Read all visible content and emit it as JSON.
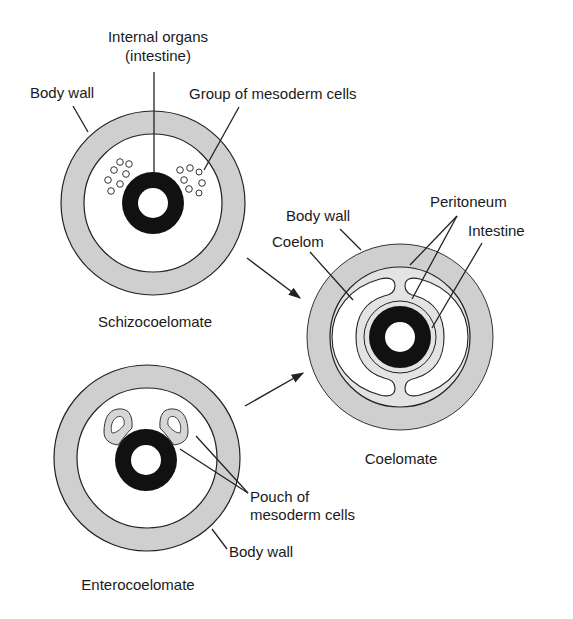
{
  "diagram": {
    "colors": {
      "background": "#ffffff",
      "body_wall": "#cfcfcf",
      "peritoneum": "#dedede",
      "intestine": "#111111",
      "outline": "#222222",
      "cavity": "#ffffff"
    },
    "schizocoelomate": {
      "title": "Schizocoelomate",
      "labels": {
        "internal_organs_line1": "Internal organs",
        "internal_organs_line2": "(intestine)",
        "body_wall": "Body wall",
        "mesoderm_group": "Group of mesoderm cells"
      }
    },
    "coelomate": {
      "title": "Coelomate",
      "labels": {
        "body_wall": "Body wall",
        "coelom": "Coelom",
        "peritoneum": "Peritoneum",
        "intestine": "Intestine"
      }
    },
    "enterocoelomate": {
      "title": "Enterocoelomate",
      "labels": {
        "pouch_line1": "Pouch of",
        "pouch_line2": "mesoderm cells",
        "body_wall": "Body wall"
      }
    },
    "arrows": [
      {
        "from": "schizocoelomate",
        "to": "coelomate"
      },
      {
        "from": "enterocoelomate",
        "to": "coelomate"
      }
    ]
  }
}
